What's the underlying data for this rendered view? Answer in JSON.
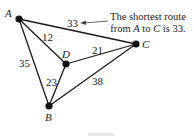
{
  "nodes": [
    {
      "id": "A",
      "label": "A",
      "x": 19,
      "y": 19
    },
    {
      "id": "B",
      "label": "B",
      "x": 49,
      "y": 106
    },
    {
      "id": "C",
      "label": "C",
      "x": 136,
      "y": 44
    },
    {
      "id": "D",
      "label": "D",
      "x": 66,
      "y": 64
    }
  ],
  "edges": [
    {
      "from": "A",
      "to": "C",
      "weight": "33"
    },
    {
      "from": "A",
      "to": "D",
      "weight": "12"
    },
    {
      "from": "A",
      "to": "B",
      "weight": "35"
    },
    {
      "from": "D",
      "to": "C",
      "weight": "21"
    },
    {
      "from": "D",
      "to": "B",
      "weight": "23"
    },
    {
      "from": "B",
      "to": "C",
      "weight": "38"
    }
  ],
  "annotation": {
    "line1": "The shortest route",
    "line2_pre": "from ",
    "line2_a": "A",
    "line2_mid": " to ",
    "line2_c": "C",
    "line2_post": " is 33."
  }
}
